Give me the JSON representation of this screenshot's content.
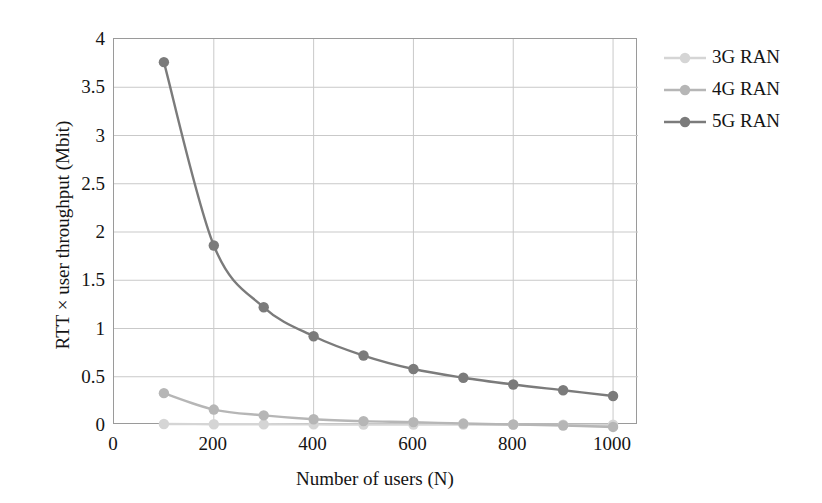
{
  "chart_data": {
    "type": "line",
    "title": "",
    "xlabel": "Number of users (N)",
    "ylabel": "RTT × user throughput (Mbit)",
    "x": [
      100,
      200,
      300,
      400,
      500,
      600,
      700,
      800,
      900,
      1000
    ],
    "xlim": [
      0,
      1050
    ],
    "ylim": [
      0,
      4
    ],
    "xticks": [
      "0",
      "200",
      "400",
      "600",
      "800",
      "1000"
    ],
    "xtick_values": [
      0,
      200,
      400,
      600,
      800,
      1000
    ],
    "yticks": [
      "0",
      "0.5",
      "1",
      "1.5",
      "2",
      "2.5",
      "3",
      "3.5",
      "4"
    ],
    "ytick_values": [
      0,
      0.5,
      1,
      1.5,
      2,
      2.5,
      3,
      3.5,
      4
    ],
    "grid": true,
    "legend_position": "right",
    "series": [
      {
        "name": "3G RAN",
        "color": "#d5d5d5",
        "values": [
          0.01,
          0.008,
          0.007,
          0.006,
          0.005,
          0.005,
          0.004,
          0.004,
          0.003,
          0.003
        ]
      },
      {
        "name": "4G RAN",
        "color": "#b6b6b6",
        "values": [
          0.33,
          0.16,
          0.1,
          0.06,
          0.04,
          0.03,
          0.015,
          0.005,
          -0.005,
          -0.02
        ]
      },
      {
        "name": "5G RAN",
        "color": "#7b7b7b",
        "values": [
          3.76,
          1.86,
          1.22,
          0.92,
          0.72,
          0.58,
          0.49,
          0.42,
          0.36,
          0.3
        ]
      }
    ]
  },
  "legend": {
    "items": [
      {
        "label": "3G RAN",
        "color": "#d5d5d5"
      },
      {
        "label": "4G RAN",
        "color": "#b6b6b6"
      },
      {
        "label": "5G RAN",
        "color": "#7b7b7b"
      }
    ]
  },
  "colors": {
    "grid": "#c9c9c9",
    "axis": "#9a9a9a",
    "text": "#141414",
    "background": "#ffffff"
  }
}
